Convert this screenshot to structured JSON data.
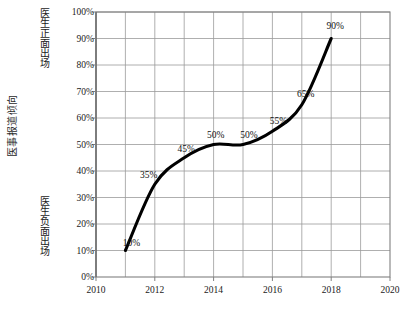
{
  "chart_data": {
    "type": "line",
    "title": "",
    "subtitle": "",
    "xlabel": "",
    "ylabel": "医事报道倾向",
    "xlim": [
      2010,
      2020
    ],
    "ylim": [
      0,
      100
    ],
    "grid": true,
    "legend": "none",
    "line_color": "#000000",
    "grid_color": "#9a9a9a",
    "axis_color": "#808080",
    "x": [
      2011,
      2012,
      2013,
      2014,
      2015,
      2016,
      2017,
      2018
    ],
    "values": [
      10,
      35,
      45,
      50,
      50,
      55,
      65,
      90
    ],
    "point_labels": [
      "10%",
      "35%",
      "45%",
      "50%",
      "50%",
      "55%",
      "65%",
      "90%"
    ],
    "xticks": [
      "2010",
      "2012",
      "2014",
      "2016",
      "2018",
      "2020"
    ],
    "xtick_values": [
      2010,
      2012,
      2014,
      2016,
      2018,
      2020
    ],
    "yticks": [
      "0%",
      "10%",
      "20%",
      "30%",
      "40%",
      "50%",
      "60%",
      "70%",
      "80%",
      "90%",
      "100%"
    ],
    "ytick_values": [
      0,
      10,
      20,
      30,
      40,
      50,
      60,
      70,
      80,
      90,
      100
    ],
    "annotations": {
      "axis_caption": "医事报道倾向",
      "top_region": "医生正面出场",
      "bottom_region": "医生负面出场"
    }
  },
  "axis": {
    "outer_caption": "医事报道倾向"
  },
  "regions": {
    "positive_label": "医生正面出场",
    "negative_label": "医生负面出场"
  }
}
